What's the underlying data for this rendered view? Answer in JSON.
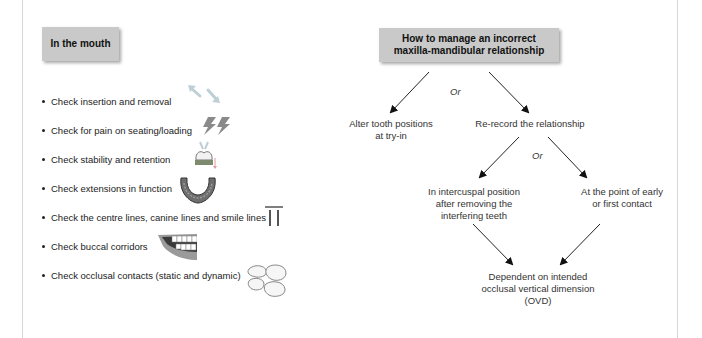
{
  "left_panel": {
    "heading": "In the mouth",
    "items": [
      {
        "label": "Check insertion and removal",
        "icon": "insertion-removal-arrows-icon"
      },
      {
        "label": "Check for pain on seating/loading",
        "icon": "lightning-pain-icon"
      },
      {
        "label": "Check stability and retention",
        "icon": "tooth-stability-icon"
      },
      {
        "label": "Check extensions in function",
        "icon": "denture-arch-icon"
      },
      {
        "label": "Check the centre lines, canine lines and smile lines",
        "icon": "centre-lines-icon"
      },
      {
        "label": "Check buccal corridors",
        "icon": "smile-teeth-icon"
      },
      {
        "label": "Check occlusal contacts (static and dynamic)",
        "icon": "occlusal-teeth-icon"
      }
    ]
  },
  "flowchart": {
    "title_line1": "How to manage an incorrect",
    "title_line2": "maxilla-mandibular relationship",
    "or_1": "Or",
    "or_2": "Or",
    "option_alter_line1": "Alter tooth positions",
    "option_alter_line2": "at try-in",
    "option_rerecord": "Re-record the relationship",
    "sub_icp_line1": "In intercuspal position",
    "sub_icp_line2": "after removing the",
    "sub_icp_line3": "interfering teeth",
    "sub_early_line1": "At the point of early",
    "sub_early_line2": "or first contact",
    "result_line1": "Dependent on intended",
    "result_line2": "occlusal vertical dimension",
    "result_line3": "(OVD)"
  },
  "colors": {
    "box_fill": "#c9c9c9",
    "border_line": "#d6d6d6",
    "text": "#222222"
  }
}
